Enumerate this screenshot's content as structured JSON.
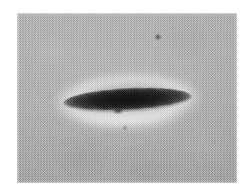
{
  "figure": {
    "kind": "photomicrograph",
    "caption": "",
    "canvas": {
      "width": 249,
      "height": 191,
      "background": "#ffffff"
    },
    "plate": {
      "label": "micrograph plate",
      "x": 17,
      "y": 13,
      "width": 220,
      "height": 170,
      "background_tone": "#a8a8a8",
      "texture": "halftone dither grain",
      "border": "none"
    },
    "subject": {
      "label": "dark lens-shaped specimen",
      "shape": "biconvex lens / spindle",
      "center_x": 127,
      "center_y": 100,
      "length": 129,
      "thickness": 24,
      "tilt_degrees": -3,
      "core_color": "#141414",
      "edge_color": "#5d5d5d",
      "left_tip_x": 63,
      "right_tip_x": 192
    },
    "halo": {
      "label": "bright phase-contrast halo",
      "center_x": 127,
      "center_y": 100,
      "width": 152,
      "height": 56,
      "color": "#ffffff",
      "strongest_region": "below subject"
    },
    "appendage": {
      "label": "small protrusion below specimen",
      "center_x": 118,
      "top_y": 108,
      "width": 12,
      "height": 13,
      "color": "#1e1e1e"
    },
    "specks": [
      {
        "label": "dark debris speck upper right",
        "x": 158,
        "y": 37,
        "size": 6,
        "color": "#4a4a4a"
      },
      {
        "label": "faint debris speck below subject",
        "x": 125,
        "y": 128,
        "size": 4,
        "color": "#6b6b6b"
      },
      {
        "label": "faint debris speck lower right",
        "x": 213,
        "y": 142,
        "size": 3,
        "color": "#8a8a8a"
      },
      {
        "label": "faint debris speck left",
        "x": 49,
        "y": 96,
        "size": 3,
        "color": "#8d8d8d"
      }
    ]
  }
}
